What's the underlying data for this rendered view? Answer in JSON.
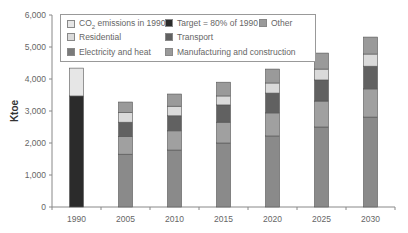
{
  "chart_data": {
    "type": "bar",
    "stacked": true,
    "title": "",
    "xlabel": "",
    "ylabel": "Ktoe",
    "ylim": [
      0,
      6000
    ],
    "yticks": [
      "0",
      "1,000",
      "2,000",
      "3,000",
      "4,000",
      "5,000",
      "6,000"
    ],
    "categories": [
      "1990",
      "2005",
      "2010",
      "2015",
      "2020",
      "2025",
      "2030"
    ],
    "grid": false,
    "legend_position": "top-inside",
    "series": [
      {
        "name": "Target = 80% of 1990",
        "color": "#2b2b2b",
        "values": [
          3470,
          0,
          0,
          0,
          0,
          0,
          0
        ]
      },
      {
        "name": "CO2 emissions in 1990",
        "color": "#e6e6e6",
        "values": [
          870,
          0,
          0,
          0,
          0,
          0,
          0
        ]
      },
      {
        "name": "Manufacturing and construction",
        "color": "#8a8a8a",
        "values": [
          0,
          1650,
          1780,
          2000,
          2220,
          2500,
          2810
        ]
      },
      {
        "name": "Electricity and heat",
        "color": "#a0a0a0",
        "values": [
          0,
          550,
          600,
          650,
          720,
          810,
          880
        ]
      },
      {
        "name": "Transport",
        "color": "#616161",
        "values": [
          0,
          450,
          470,
          540,
          620,
          660,
          710
        ]
      },
      {
        "name": "Residential",
        "color": "#dadada",
        "values": [
          0,
          300,
          300,
          280,
          315,
          340,
          380
        ]
      },
      {
        "name": "Other",
        "color": "#9a9a9a",
        "values": [
          0,
          330,
          380,
          430,
          435,
          500,
          530
        ]
      }
    ],
    "totals": [
      4340,
      3280,
      3530,
      3900,
      4310,
      4810,
      5310
    ]
  },
  "legend": {
    "items": [
      {
        "label_main": "CO",
        "label_sub": "2",
        "label_rest": " emissions in 1990",
        "color": "#e6e6e6"
      },
      {
        "label": "Target = 80% of 1990",
        "color": "#2b2b2b"
      },
      {
        "label": "Other",
        "color": "#9a9a9a"
      },
      {
        "label": "Residential",
        "color": "#dadada"
      },
      {
        "label": "Transport",
        "color": "#616161"
      },
      {
        "label": "Electricity and heat",
        "color": "#7a7a7a"
      },
      {
        "label": "Manufacturing and construction",
        "color": "#9a9a9a"
      }
    ]
  }
}
